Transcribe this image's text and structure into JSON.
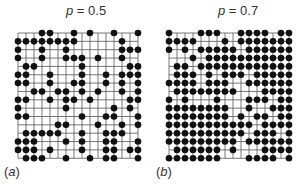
{
  "figure": {
    "panels": [
      {
        "id": "a",
        "label": "(a)",
        "title_var": "p",
        "title_rest": " = 0.5",
        "probability": 0.5,
        "grid": {
          "x0": 18,
          "y0": 33,
          "dx": 8.0,
          "dy": 8.35,
          "cols": 16,
          "rows": 16,
          "sites": [
            "0001100101001001",
            "1111111100000100",
            "1001001000000111",
            "1001001110100100",
            "0110000010000011",
            "1100100010010111",
            "1100100110010101",
            "0011011010100101",
            "1100101101000011",
            "1000001000001010",
            "1100000010011001",
            "0000011000100101",
            "0111110010011100",
            "1110001010011001",
            "1110100010011011",
            "0111001001011001"
          ]
        }
      },
      {
        "id": "b",
        "label": "(b)",
        "title_var": "p",
        "title_rest": " = 0.7",
        "probability": 0.7,
        "grid": {
          "x0": 169,
          "y0": 33,
          "dx": 8.0,
          "dy": 8.35,
          "cols": 16,
          "rows": 16,
          "sites": [
            "1000111001111011",
            "1111000101111111",
            "1010111110111111",
            "0001011111111111",
            "0110111111111111",
            "0111010111011111",
            "1111011100111111",
            "0111111110001111",
            "1010001000111011",
            "1111111100100111",
            "1111111101011011",
            "1111111111101111",
            "1111111111011101",
            "1111111110111111",
            "0111111010001111",
            "1111111000111101"
          ]
        }
      }
    ],
    "colors": {
      "line": "#555555",
      "dot": "#111111",
      "text": "#333333"
    }
  }
}
